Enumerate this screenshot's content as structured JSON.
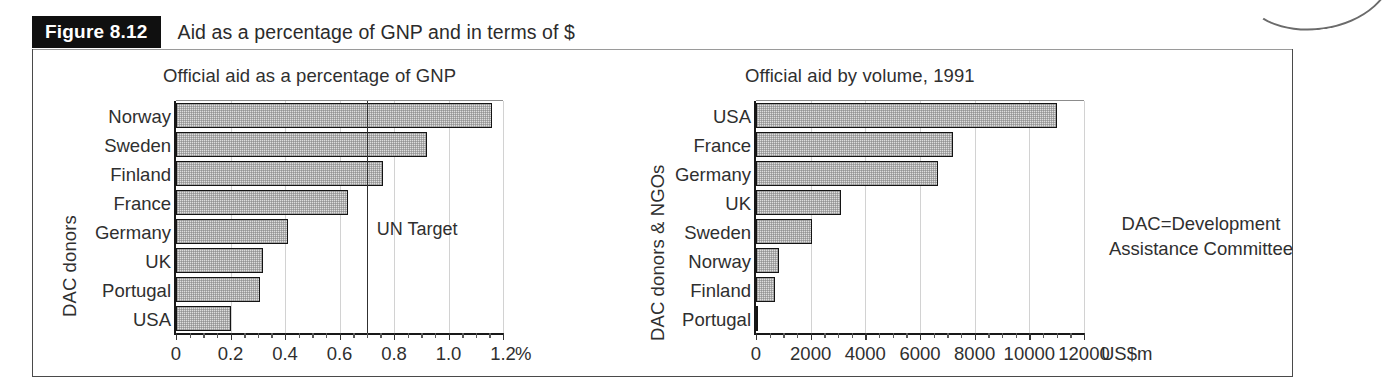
{
  "figure": {
    "tag": "Figure 8.12",
    "title": "Aid as a percentage of GNP and in terms of $",
    "note": "DAC=Development\nAssistance Committee",
    "note_line1": "DAC=Development",
    "note_line2": "Assistance Committee"
  },
  "chart_data": [
    {
      "type": "bar",
      "orientation": "horizontal",
      "id": "official-aid-percentage-gnp",
      "title": "Official aid as a percentage of GNP",
      "xlabel": "%",
      "ylabel": "DAC donors",
      "xlim": [
        0,
        1.2
      ],
      "xticks": [
        0,
        0.2,
        0.4,
        0.6,
        0.8,
        1.0,
        1.2
      ],
      "xtick_labels": [
        "0",
        "0.2",
        "0.4",
        "0.6",
        "0.8",
        "1.0",
        "1.2"
      ],
      "minor_tick_step": 0.05,
      "grid": true,
      "legend": "none",
      "categories": [
        "Norway",
        "Sweden",
        "Finland",
        "France",
        "Germany",
        "UK",
        "Portugal",
        "USA"
      ],
      "values": [
        1.16,
        0.92,
        0.76,
        0.63,
        0.41,
        0.32,
        0.31,
        0.2
      ],
      "annotations": [
        {
          "name": "UN Target",
          "label": "UN Target",
          "value": 0.7,
          "kind": "vertical-reference-line"
        }
      ]
    },
    {
      "type": "bar",
      "orientation": "horizontal",
      "id": "official-aid-by-volume-1991",
      "title": "Official aid by volume, 1991",
      "xlabel": "US$m",
      "ylabel": "DAC donors & NGOs",
      "xlim": [
        0,
        12000
      ],
      "xticks": [
        0,
        2000,
        4000,
        6000,
        8000,
        10000,
        12000
      ],
      "xtick_labels": [
        "0",
        "2000",
        "4000",
        "6000",
        "8000",
        "10000",
        "12000"
      ],
      "minor_tick_step": 500,
      "grid": true,
      "legend": "none",
      "categories": [
        "USA",
        "France",
        "Germany",
        "UK",
        "Sweden",
        "Norway",
        "Finland",
        "Portugal"
      ],
      "values": [
        11000,
        7200,
        6650,
        3100,
        2050,
        850,
        700,
        80
      ],
      "annotations": []
    }
  ],
  "colors": {
    "bar_fill": "#dedede",
    "bar_stroke": "#141414",
    "axis": "#181818",
    "grid": "#d2d2d2",
    "text": "#2f2f2f",
    "tag_background": "#101010",
    "tag_text": "#ffffff"
  }
}
